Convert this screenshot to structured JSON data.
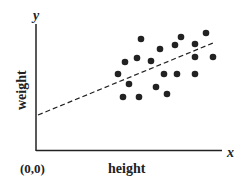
{
  "chart_data": {
    "type": "scatter",
    "title": "",
    "xlabel": "height",
    "ylabel": "weight",
    "x_axis_symbol": "x",
    "y_axis_symbol": "y",
    "origin_label": "(0,0)",
    "grid": false,
    "trendline": {
      "style": "dashed",
      "from_px": [
        38,
        115
      ],
      "to_px": [
        213,
        43
      ]
    },
    "points_px": [
      [
        141,
        39
      ],
      [
        181,
        37
      ],
      [
        206,
        33
      ],
      [
        160,
        49
      ],
      [
        175,
        45
      ],
      [
        195,
        44
      ],
      [
        195,
        57
      ],
      [
        213,
        57
      ],
      [
        125,
        62
      ],
      [
        137,
        58
      ],
      [
        151,
        61
      ],
      [
        118,
        74
      ],
      [
        164,
        74
      ],
      [
        177,
        74
      ],
      [
        195,
        74
      ],
      [
        129,
        84
      ],
      [
        156,
        87
      ],
      [
        167,
        94
      ],
      [
        123,
        97
      ],
      [
        139,
        97
      ]
    ],
    "point_color": "#222222"
  }
}
